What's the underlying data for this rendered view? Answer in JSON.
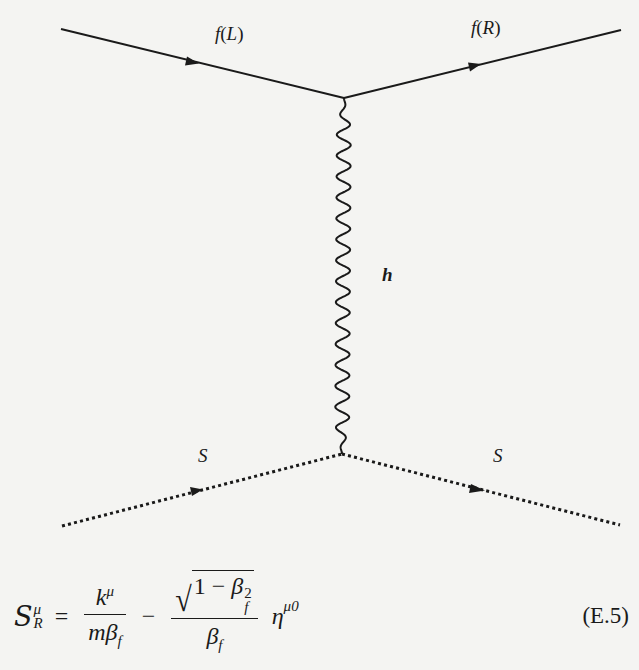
{
  "diagram": {
    "type": "feynman-diagram",
    "vertices": [
      {
        "id": "top-vertex",
        "x": 344,
        "y": 98
      },
      {
        "id": "bottom-vertex",
        "x": 342,
        "y": 454
      }
    ],
    "lines": [
      {
        "id": "fermion-in",
        "kind": "solid-arrow",
        "from": [
          61,
          29
        ],
        "to": [
          344,
          98
        ],
        "label": "f(L)"
      },
      {
        "id": "fermion-out",
        "kind": "solid-arrow",
        "from": [
          344,
          98
        ],
        "to": [
          621,
          30
        ],
        "label": "f(R)"
      },
      {
        "id": "graviton",
        "kind": "wavy",
        "from": [
          344,
          98
        ],
        "to": [
          342,
          454
        ],
        "label": "h"
      },
      {
        "id": "scalar-in",
        "kind": "dotted-arrow",
        "from": [
          62,
          526
        ],
        "to": [
          342,
          454
        ],
        "label": "S"
      },
      {
        "id": "scalar-out",
        "kind": "dotted-arrow",
        "from": [
          342,
          454
        ],
        "to": [
          620,
          525
        ],
        "label": "S"
      }
    ],
    "labels": {
      "fermion_left": {
        "fn": "f",
        "open": "(",
        "arg": "L",
        "close": ")"
      },
      "fermion_right": {
        "fn": "f",
        "open": "(",
        "arg": "R",
        "close": ")"
      },
      "mediator": "h",
      "scalar_left": "S",
      "scalar_right": "S"
    }
  },
  "equation": {
    "lhs": {
      "symbol": "S",
      "sup": "μ",
      "sub": "R"
    },
    "equals": "=",
    "term1": {
      "numerator": {
        "base": "k",
        "sup": "μ"
      },
      "denominator": {
        "m": "m",
        "base": "β",
        "sub": "f"
      }
    },
    "minus": "−",
    "term2": {
      "numerator": {
        "radicand_prefix": "1 − ",
        "base": "β",
        "sup": "2",
        "sub": "f"
      },
      "denominator": {
        "base": "β",
        "sub": "f"
      }
    },
    "eta": {
      "base": "η",
      "sup": "μ0"
    },
    "number": "(E.5)"
  }
}
